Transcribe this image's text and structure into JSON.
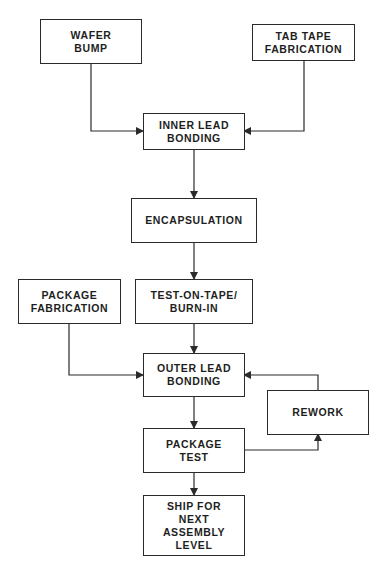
{
  "diagram": {
    "type": "flowchart",
    "colors": {
      "line": "#2a2a2a",
      "text": "#1e1e1e",
      "background": "#ffffff"
    },
    "nodes": {
      "wafer_bump": {
        "label": "WAFER\nBUMP"
      },
      "tab_tape_fabrication": {
        "label": "TAB TAPE\nFABRICATION"
      },
      "inner_lead_bonding": {
        "label": "INNER LEAD\nBONDING"
      },
      "encapsulation": {
        "label": "ENCAPSULATION"
      },
      "package_fabrication": {
        "label": "PACKAGE\nFABRICATION"
      },
      "test_on_tape": {
        "label": "TEST-ON-TAPE/\nBURN-IN"
      },
      "outer_lead_bonding": {
        "label": "OUTER LEAD\nBONDING"
      },
      "rework": {
        "label": "REWORK"
      },
      "package_test": {
        "label": "PACKAGE\nTEST"
      },
      "ship": {
        "label": "SHIP FOR\nNEXT\nASSEMBLY\nLEVEL"
      }
    },
    "edges": [
      {
        "from": "wafer_bump",
        "to": "inner_lead_bonding"
      },
      {
        "from": "tab_tape_fabrication",
        "to": "inner_lead_bonding"
      },
      {
        "from": "inner_lead_bonding",
        "to": "encapsulation"
      },
      {
        "from": "encapsulation",
        "to": "test_on_tape"
      },
      {
        "from": "test_on_tape",
        "to": "outer_lead_bonding"
      },
      {
        "from": "package_fabrication",
        "to": "outer_lead_bonding"
      },
      {
        "from": "outer_lead_bonding",
        "to": "package_test"
      },
      {
        "from": "package_test",
        "to": "rework"
      },
      {
        "from": "rework",
        "to": "outer_lead_bonding"
      },
      {
        "from": "package_test",
        "to": "ship"
      }
    ]
  }
}
